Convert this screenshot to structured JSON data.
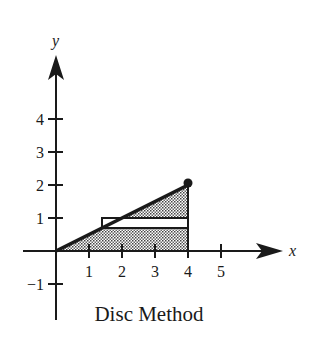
{
  "figure": {
    "caption": "Disc Method",
    "axes": {
      "x_label": "x",
      "y_label": "y",
      "x_ticks": [
        "1",
        "2",
        "3",
        "4",
        "5"
      ],
      "y_ticks": [
        "4",
        "3",
        "2",
        "1",
        "-1"
      ],
      "y_tick_minus_one": "−1"
    },
    "curve": {
      "equation": "y = x/2",
      "from": [
        0,
        0
      ],
      "to": [
        4,
        2
      ],
      "endpoint_marker": "filled-dot"
    },
    "shaded_region": {
      "description": "region under y = x/2 from x=0 to x=4",
      "pattern": "dotted"
    },
    "representative_rectangle": {
      "x_from": 1.4,
      "x_to": 4,
      "y_from": 0.7,
      "y_to": 1.0,
      "fill": "white"
    },
    "colors": {
      "ink": "#1a1a1a",
      "background": "#ffffff",
      "shade": "#b0b0b0"
    }
  }
}
